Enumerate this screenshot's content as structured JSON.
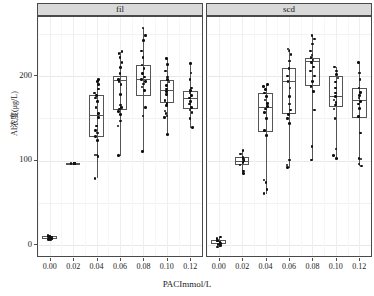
{
  "figure": {
    "y_axis_title": "Al浓度(μg/L)",
    "x_axis_title": "PACImmol/L",
    "panel_labels": [
      "fil",
      "scd"
    ]
  },
  "axis": {
    "y_ticks": [
      "0",
      "100",
      "200"
    ],
    "x_ticks": [
      "0.00",
      "0.02",
      "0.04",
      "0.06",
      "0.08",
      "0.10",
      "0.12"
    ]
  },
  "chart_data": {
    "type": "box",
    "title": "",
    "subtitle": "",
    "xlabel": "PACImmol/L",
    "ylabel": "Al浓度(μg/L)",
    "xlim": [
      -0.01,
      0.13
    ],
    "ylim": [
      -15,
      270
    ],
    "ytick_values": [
      0,
      100,
      200
    ],
    "ytick_labels": [
      "0",
      "100",
      "200"
    ],
    "y_major_gridlines": [
      0,
      100,
      200
    ],
    "y_minor_gridlines": [
      50,
      150,
      250
    ],
    "xtick_values": [
      0.0,
      0.02,
      0.04,
      0.06,
      0.08,
      0.1,
      0.12
    ],
    "xtick_labels": [
      "0.00",
      "0.02",
      "0.04",
      "0.06",
      "0.08",
      "0.10",
      "0.12"
    ],
    "grid": true,
    "legend": "none",
    "facets": [
      {
        "name": "fil",
        "categories": [
          "0.00",
          "0.02",
          "0.04",
          "0.06",
          "0.08",
          "0.10",
          "0.12"
        ],
        "boxes": [
          {
            "x": "0.00",
            "min": 6,
            "q1": 7,
            "median": 9,
            "q3": 11,
            "max": 12,
            "points": [
              7,
              8,
              9,
              9,
              10,
              10,
              11,
              11,
              12,
              8,
              9,
              10,
              7,
              11,
              9
            ]
          },
          {
            "x": "0.02",
            "min": 96,
            "q1": 96.5,
            "median": 97,
            "q3": 97.5,
            "max": 98,
            "points": [
              97,
              97,
              97,
              97,
              97
            ]
          },
          {
            "x": "0.04",
            "min": 79,
            "q1": 128,
            "median": 154,
            "q3": 178,
            "max": 196,
            "points": [
              79,
              105,
              107,
              107,
              124,
              129,
              133,
              136,
              141,
              151,
              156,
              163,
              170,
              174,
              177,
              180,
              185,
              190,
              194,
              196
            ]
          },
          {
            "x": "0.06",
            "min": 106,
            "q1": 160,
            "median": 196,
            "q3": 200,
            "max": 229,
            "points": [
              106,
              141,
              147,
              155,
              158,
              161,
              163,
              166,
              178,
              190,
              194,
              196,
              203,
              210,
              216,
              222,
              227,
              229
            ]
          },
          {
            "x": "0.08",
            "min": 111,
            "q1": 177,
            "median": 197,
            "q3": 213,
            "max": 257,
            "points": [
              111,
              153,
              163,
              183,
              187,
              191,
              194,
              196,
              199,
              203,
              209,
              213,
              222,
              230,
              242,
              248,
              257
            ]
          },
          {
            "x": "0.10",
            "min": 131,
            "q1": 168,
            "median": 184,
            "q3": 196,
            "max": 221,
            "points": [
              131,
              151,
              153,
              156,
              159,
              165,
              168,
              171,
              178,
              182,
              185,
              189,
              193,
              196,
              199,
              206,
              214,
              221
            ]
          },
          {
            "x": "0.12",
            "min": 139,
            "q1": 161,
            "median": 174,
            "q3": 183,
            "max": 215,
            "points": [
              139,
              150,
              157,
              160,
              163,
              167,
              170,
              174,
              177,
              180,
              183,
              186,
              196,
              204,
              215
            ]
          }
        ]
      },
      {
        "name": "scd",
        "categories": [
          "0.00",
          "0.02",
          "0.04",
          "0.06",
          "0.08",
          "0.10",
          "0.12"
        ],
        "boxes": [
          {
            "x": "0.00",
            "min": -2,
            "q1": 1,
            "median": 3,
            "q3": 6,
            "max": 10,
            "points": [
              -2,
              0,
              1,
              2,
              3,
              4,
              5,
              6,
              8,
              10
            ]
          },
          {
            "x": "0.02",
            "min": 85,
            "q1": 95,
            "median": 100,
            "q3": 104,
            "max": 112,
            "points": [
              85,
              88,
              95,
              98,
              100,
              102,
              104,
              108,
              112
            ]
          },
          {
            "x": "0.04",
            "min": 61,
            "q1": 134,
            "median": 164,
            "q3": 180,
            "max": 190,
            "points": [
              61,
              66,
              74,
              77,
              130,
              136,
              150,
              157,
              161,
              164,
              168,
              172,
              176,
              180,
              184,
              188,
              190
            ]
          },
          {
            "x": "0.06",
            "min": 92,
            "q1": 155,
            "median": 194,
            "q3": 210,
            "max": 232,
            "points": [
              92,
              95,
              101,
              144,
              150,
              155,
              160,
              167,
              176,
              186,
              194,
              200,
              209,
              218,
              226,
              230,
              232
            ]
          },
          {
            "x": "0.08",
            "min": 101,
            "q1": 188,
            "median": 218,
            "q3": 222,
            "max": 248,
            "points": [
              101,
              117,
              160,
              182,
              188,
              194,
              200,
              206,
              211,
              216,
              219,
              222,
              225,
              230,
              238,
              244,
              248
            ]
          },
          {
            "x": "0.10",
            "min": 103,
            "q1": 163,
            "median": 176,
            "q3": 200,
            "max": 211,
            "points": [
              103,
              106,
              114,
              150,
              161,
              166,
              169,
              172,
              176,
              180,
              186,
              193,
              198,
              202,
              206,
              211
            ]
          },
          {
            "x": "0.12",
            "min": 94,
            "q1": 150,
            "median": 172,
            "q3": 186,
            "max": 216,
            "points": [
              94,
              96,
              102,
              103,
              133,
              152,
              162,
              167,
              170,
              174,
              177,
              181,
              186,
              196,
              204,
              216
            ]
          }
        ]
      }
    ]
  }
}
